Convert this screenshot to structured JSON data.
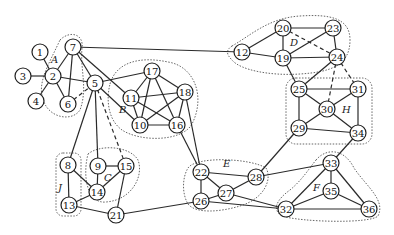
{
  "diagram": {
    "type": "community-network-graph",
    "nodes": [
      {
        "id": "1",
        "x": 40,
        "y": 52
      },
      {
        "id": "2",
        "x": 53,
        "y": 76
      },
      {
        "id": "3",
        "x": 23,
        "y": 76
      },
      {
        "id": "4",
        "x": 36,
        "y": 101
      },
      {
        "id": "5",
        "x": 95,
        "y": 83
      },
      {
        "id": "6",
        "x": 68,
        "y": 104
      },
      {
        "id": "7",
        "x": 73,
        "y": 47
      },
      {
        "id": "8",
        "x": 68,
        "y": 165
      },
      {
        "id": "9",
        "x": 98,
        "y": 166
      },
      {
        "id": "10",
        "x": 140,
        "y": 125
      },
      {
        "id": "11",
        "x": 131,
        "y": 98
      },
      {
        "id": "12",
        "x": 242,
        "y": 52
      },
      {
        "id": "13",
        "x": 69,
        "y": 205
      },
      {
        "id": "14",
        "x": 97,
        "y": 192
      },
      {
        "id": "15",
        "x": 126,
        "y": 166
      },
      {
        "id": "16",
        "x": 177,
        "y": 125
      },
      {
        "id": "17",
        "x": 152,
        "y": 71
      },
      {
        "id": "18",
        "x": 185,
        "y": 92
      },
      {
        "id": "19",
        "x": 283,
        "y": 58
      },
      {
        "id": "20",
        "x": 283,
        "y": 28
      },
      {
        "id": "21",
        "x": 116,
        "y": 215
      },
      {
        "id": "22",
        "x": 201,
        "y": 172
      },
      {
        "id": "23",
        "x": 333,
        "y": 28
      },
      {
        "id": "24",
        "x": 337,
        "y": 57
      },
      {
        "id": "25",
        "x": 299,
        "y": 89
      },
      {
        "id": "26",
        "x": 201,
        "y": 201
      },
      {
        "id": "27",
        "x": 226,
        "y": 193
      },
      {
        "id": "28",
        "x": 256,
        "y": 177
      },
      {
        "id": "29",
        "x": 299,
        "y": 128
      },
      {
        "id": "30",
        "x": 327,
        "y": 109
      },
      {
        "id": "31",
        "x": 358,
        "y": 89
      },
      {
        "id": "32",
        "x": 286,
        "y": 209
      },
      {
        "id": "33",
        "x": 331,
        "y": 163
      },
      {
        "id": "34",
        "x": 358,
        "y": 133
      },
      {
        "id": "35",
        "x": 331,
        "y": 191
      },
      {
        "id": "36",
        "x": 369,
        "y": 209
      }
    ],
    "edges": [
      [
        "1",
        "2"
      ],
      [
        "3",
        "2"
      ],
      [
        "4",
        "2"
      ],
      [
        "2",
        "7"
      ],
      [
        "2",
        "6"
      ],
      [
        "2",
        "5"
      ],
      [
        "7",
        "6"
      ],
      [
        "7",
        "5"
      ],
      [
        "7",
        "11"
      ],
      [
        "7",
        "12"
      ],
      [
        "5",
        "17"
      ],
      [
        "5",
        "10"
      ],
      [
        "5",
        "8"
      ],
      [
        "5",
        "9"
      ],
      [
        "11",
        "10"
      ],
      [
        "11",
        "18"
      ],
      [
        "11",
        "16"
      ],
      [
        "17",
        "11"
      ],
      [
        "17",
        "10"
      ],
      [
        "17",
        "16"
      ],
      [
        "17",
        "18"
      ],
      [
        "18",
        "10"
      ],
      [
        "18",
        "16"
      ],
      [
        "10",
        "16"
      ],
      [
        "16",
        "22"
      ],
      [
        "18",
        "22"
      ],
      [
        "12",
        "20"
      ],
      [
        "12",
        "19"
      ],
      [
        "20",
        "23"
      ],
      [
        "20",
        "19"
      ],
      [
        "19",
        "23"
      ],
      [
        "19",
        "24"
      ],
      [
        "23",
        "24"
      ],
      [
        "19",
        "25"
      ],
      [
        "24",
        "25"
      ],
      [
        "25",
        "31"
      ],
      [
        "25",
        "29"
      ],
      [
        "25",
        "30"
      ],
      [
        "31",
        "30"
      ],
      [
        "31",
        "34"
      ],
      [
        "30",
        "29"
      ],
      [
        "30",
        "34"
      ],
      [
        "29",
        "34"
      ],
      [
        "29",
        "28"
      ],
      [
        "34",
        "33"
      ],
      [
        "9",
        "15"
      ],
      [
        "9",
        "14"
      ],
      [
        "15",
        "14"
      ],
      [
        "15",
        "21"
      ],
      [
        "8",
        "13"
      ],
      [
        "8",
        "14"
      ],
      [
        "14",
        "13"
      ],
      [
        "13",
        "21"
      ],
      [
        "21",
        "26"
      ],
      [
        "22",
        "28"
      ],
      [
        "22",
        "26"
      ],
      [
        "22",
        "27"
      ],
      [
        "27",
        "28"
      ],
      [
        "26",
        "27"
      ],
      [
        "27",
        "32"
      ],
      [
        "26",
        "32"
      ],
      [
        "28",
        "33"
      ],
      [
        "33",
        "35"
      ],
      [
        "33",
        "32"
      ],
      [
        "33",
        "36"
      ],
      [
        "35",
        "32"
      ],
      [
        "35",
        "36"
      ],
      [
        "32",
        "36"
      ]
    ],
    "dashed_edges": [
      [
        "6",
        "5"
      ],
      [
        "5",
        "15"
      ],
      [
        "24",
        "30"
      ],
      [
        "24",
        "31"
      ],
      [
        "20",
        "24"
      ]
    ],
    "groups": [
      {
        "label": "A",
        "lx": 51,
        "ly": 63
      },
      {
        "label": "B",
        "lx": 119,
        "ly": 113
      },
      {
        "label": "C",
        "lx": 104,
        "ly": 181
      },
      {
        "label": "D",
        "lx": 290,
        "ly": 46
      },
      {
        "label": "E",
        "lx": 223,
        "ly": 167
      },
      {
        "label": "F",
        "lx": 313,
        "ly": 191
      },
      {
        "label": "H",
        "lx": 342,
        "ly": 113
      },
      {
        "label": "J",
        "lx": 58,
        "ly": 191
      }
    ]
  }
}
